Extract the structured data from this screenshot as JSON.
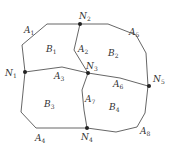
{
  "diagram": {
    "nodes": [
      {
        "id": "N1",
        "label": "N",
        "sub": "1",
        "x": 25,
        "y": 72,
        "lx": 5,
        "ly": 76
      },
      {
        "id": "N2",
        "label": "N",
        "sub": "2",
        "x": 80,
        "y": 24,
        "lx": 79,
        "ly": 19
      },
      {
        "id": "N3",
        "label": "N",
        "sub": "3",
        "x": 88,
        "y": 73,
        "lx": 86,
        "ly": 69
      },
      {
        "id": "N4",
        "label": "N",
        "sub": "4",
        "x": 87,
        "y": 128,
        "lx": 81,
        "ly": 140
      },
      {
        "id": "N5",
        "label": "N",
        "sub": "5",
        "x": 149,
        "y": 86,
        "lx": 153,
        "ly": 82
      }
    ],
    "edges_labels": [
      {
        "label": "A",
        "sub": "1",
        "x": 24,
        "y": 33
      },
      {
        "label": "A",
        "sub": "2",
        "x": 78,
        "y": 52
      },
      {
        "label": "A",
        "sub": "3",
        "x": 54,
        "y": 79
      },
      {
        "label": "A",
        "sub": "4",
        "x": 35,
        "y": 141
      },
      {
        "label": "A",
        "sub": "5",
        "x": 129,
        "y": 35
      },
      {
        "label": "A",
        "sub": "6",
        "x": 113,
        "y": 87
      },
      {
        "label": "A",
        "sub": "7",
        "x": 85,
        "y": 102
      },
      {
        "label": "A",
        "sub": "8",
        "x": 140,
        "y": 134
      }
    ],
    "regions": [
      {
        "label": "B",
        "sub": "1",
        "x": 46,
        "y": 52
      },
      {
        "label": "B",
        "sub": "2",
        "x": 108,
        "y": 56
      },
      {
        "label": "B",
        "sub": "3",
        "x": 44,
        "y": 107
      },
      {
        "label": "B",
        "sub": "4",
        "x": 109,
        "y": 110
      }
    ],
    "colors": {
      "line": "#555555",
      "node": "#222222",
      "text": "#333333"
    }
  }
}
